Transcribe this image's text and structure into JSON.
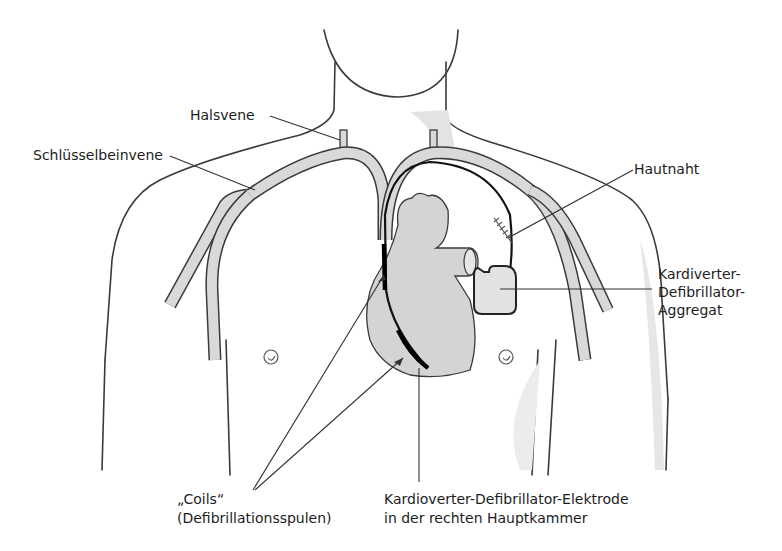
{
  "diagram": {
    "colors": {
      "vessel_fill": "#d9d9d9",
      "heart_fill": "#d4d4d4",
      "outline": "#3a3a3a",
      "lead": "#111111",
      "background": "#ffffff"
    },
    "labels": {
      "halsvene": "Halsvene",
      "schluesselbeinvene": "Schlüsselbeinvene",
      "hautnaht": "Hautnaht",
      "aggregat": [
        "Kardiverter-",
        "Defibrillator-",
        "Aggregat"
      ],
      "coils": [
        "„Coils“",
        "(Defibrillationsspulen)"
      ],
      "elektrode": [
        "Kardioverter-Defibrillator-Elektrode",
        "in der rechten Hauptkammer"
      ]
    }
  }
}
